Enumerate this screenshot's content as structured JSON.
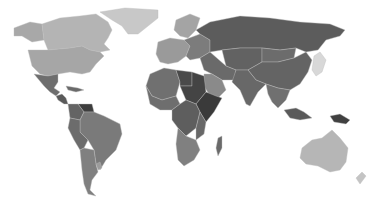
{
  "map": {
    "type": "choropleth",
    "style": "grayscale",
    "background": "#ffffff",
    "regions": [
      {
        "id": "greenland",
        "fill": "#c8c8c8"
      },
      {
        "id": "canada",
        "fill": "#b4b4b4"
      },
      {
        "id": "alaska",
        "fill": "#a8a8a8"
      },
      {
        "id": "usa",
        "fill": "#a6a6a6"
      },
      {
        "id": "mexico",
        "fill": "#6e6e6e"
      },
      {
        "id": "central-america",
        "fill": "#5a5a5a"
      },
      {
        "id": "caribbean",
        "fill": "#6a6a6a"
      },
      {
        "id": "venezuela",
        "fill": "#3e3e3e"
      },
      {
        "id": "colombia",
        "fill": "#646464"
      },
      {
        "id": "brazil",
        "fill": "#7a7a7a"
      },
      {
        "id": "andes",
        "fill": "#6c6c6c"
      },
      {
        "id": "southern-cone",
        "fill": "#808080"
      },
      {
        "id": "uruguay",
        "fill": "#9c9c9c"
      },
      {
        "id": "scandinavia",
        "fill": "#a4a4a4"
      },
      {
        "id": "western-europe",
        "fill": "#9a9a9a"
      },
      {
        "id": "eastern-europe",
        "fill": "#7c7c7c"
      },
      {
        "id": "russia",
        "fill": "#5c5c5c"
      },
      {
        "id": "central-asia",
        "fill": "#626262"
      },
      {
        "id": "middle-east",
        "fill": "#6a6a6a"
      },
      {
        "id": "arabia",
        "fill": "#8a8a8a"
      },
      {
        "id": "north-africa",
        "fill": "#707070"
      },
      {
        "id": "libya",
        "fill": "#4a4a4a"
      },
      {
        "id": "sudan",
        "fill": "#444444"
      },
      {
        "id": "west-africa",
        "fill": "#6e6e6e"
      },
      {
        "id": "horn-of-africa",
        "fill": "#3a3a3a"
      },
      {
        "id": "central-africa",
        "fill": "#5e5e5e"
      },
      {
        "id": "east-africa",
        "fill": "#686868"
      },
      {
        "id": "southern-africa",
        "fill": "#808080"
      },
      {
        "id": "madagascar",
        "fill": "#6a6a6a"
      },
      {
        "id": "china",
        "fill": "#646464"
      },
      {
        "id": "mongolia",
        "fill": "#6c6c6c"
      },
      {
        "id": "india",
        "fill": "#686868"
      },
      {
        "id": "southeast-asia",
        "fill": "#707070"
      },
      {
        "id": "japan-korea",
        "fill": "#d8d8d8"
      },
      {
        "id": "indonesia",
        "fill": "#5a5a5a"
      },
      {
        "id": "papua",
        "fill": "#404040"
      },
      {
        "id": "australia",
        "fill": "#b6b6b6"
      },
      {
        "id": "new-zealand",
        "fill": "#c4c4c4"
      }
    ]
  }
}
